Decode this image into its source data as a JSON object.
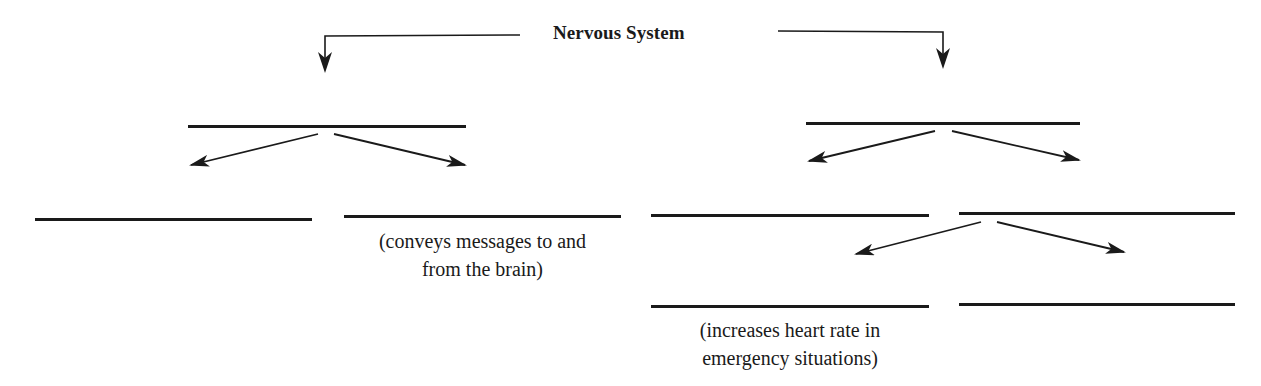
{
  "diagram": {
    "title": "Nervous System",
    "colors": {
      "ink": "#1a1a1a",
      "background": "#ffffff"
    },
    "branches": {
      "left": {
        "label": "",
        "children": [
          {
            "label": "",
            "note": ""
          },
          {
            "label": "",
            "note_line1": "(conveys messages to and",
            "note_line2": "from the brain)"
          }
        ]
      },
      "right": {
        "label": "",
        "children": [
          {
            "label": "",
            "note": ""
          },
          {
            "label": "",
            "children": [
              {
                "label": "",
                "note_line1": "(increases heart rate in",
                "note_line2": "emergency situations)"
              },
              {
                "label": "",
                "note": ""
              }
            ]
          }
        ]
      }
    }
  }
}
